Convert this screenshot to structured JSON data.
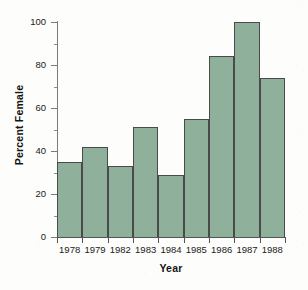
{
  "chart_data": {
    "type": "bar",
    "title": "",
    "subtitle": "",
    "xlabel": "Year",
    "ylabel": "Percent Female",
    "categories": [
      "1978",
      "1979",
      "1982",
      "1983",
      "1984",
      "1985",
      "1986",
      "1987",
      "1988"
    ],
    "values": [
      35,
      42,
      33,
      51,
      29,
      55,
      84,
      100,
      74
    ],
    "series": [
      {
        "name": "Percent Female",
        "values": [
          35,
          42,
          33,
          51,
          29,
          55,
          84,
          100,
          74
        ]
      }
    ],
    "ylim": [
      0,
      100
    ],
    "ytick_labels": [
      "0",
      "20",
      "40",
      "60",
      "80",
      "100"
    ],
    "ytick_values": [
      0,
      20,
      40,
      60,
      80,
      100
    ],
    "yminor_values": [
      10,
      30,
      50,
      70,
      90
    ],
    "grid": false,
    "legend": null,
    "legend_position": "none",
    "annotations": [],
    "bar_color": "#8fb09a",
    "bar_edge_color": "#4a4a4a",
    "axis_color": "#555555",
    "background_color": "#fdfdfb",
    "text_color": "#1a1a1a"
  }
}
